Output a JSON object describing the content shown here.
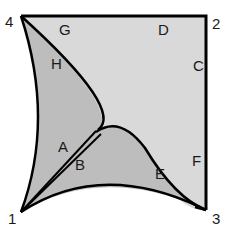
{
  "diagram": {
    "colors": {
      "light_region": "#d9d9d9",
      "dark_region": "#bdbdbd",
      "stroke": "#000000",
      "background": "#ffffff"
    },
    "corners": [
      {
        "id": "1",
        "label": "1",
        "x": 21,
        "y": 212
      },
      {
        "id": "2",
        "label": "2",
        "x": 206,
        "y": 16
      },
      {
        "id": "3",
        "label": "3",
        "x": 206,
        "y": 210
      },
      {
        "id": "4",
        "label": "4",
        "x": 21,
        "y": 16
      }
    ],
    "edge_labels": [
      {
        "id": "A",
        "label": "A"
      },
      {
        "id": "B",
        "label": "B"
      },
      {
        "id": "C",
        "label": "C"
      },
      {
        "id": "D",
        "label": "D"
      },
      {
        "id": "E",
        "label": "E"
      },
      {
        "id": "F",
        "label": "F"
      },
      {
        "id": "G",
        "label": "G"
      },
      {
        "id": "H",
        "label": "H"
      }
    ]
  }
}
